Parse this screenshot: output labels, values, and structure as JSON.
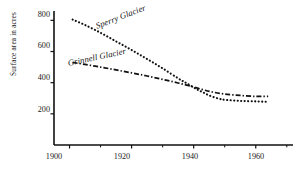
{
  "chart_data": {
    "type": "line",
    "title": "",
    "xlabel": "",
    "ylabel": "Surface area in acres",
    "xlim": [
      1895,
      1972
    ],
    "ylim": [
      0,
      860
    ],
    "grid": false,
    "legend_position": "inline-labels",
    "x_ticks": [
      1900,
      1920,
      1940,
      1960
    ],
    "x_tick_labels": [
      "1900",
      "1920",
      "1940",
      "1960"
    ],
    "x_minor_ticks": [
      1910,
      1930,
      1950,
      1970
    ],
    "y_ticks": [
      200,
      400,
      600,
      800
    ],
    "y_tick_labels": [
      "200",
      "400",
      "600",
      "800"
    ],
    "series": [
      {
        "name": "Sperry Glacier",
        "style": "dotted",
        "color": "#111111",
        "x": [
          1901,
          1905,
          1910,
          1915,
          1920,
          1925,
          1930,
          1935,
          1938,
          1941,
          1943,
          1945,
          1948,
          1950,
          1955,
          1960,
          1964
        ],
        "values": [
          805,
          770,
          720,
          665,
          610,
          552,
          492,
          428,
          393,
          358,
          338,
          318,
          298,
          290,
          283,
          280,
          277
        ]
      },
      {
        "name": "Grinnell Glacier",
        "style": "dash-dot",
        "color": "#111111",
        "x": [
          1901,
          1905,
          1910,
          1915,
          1920,
          1925,
          1930,
          1935,
          1940,
          1943,
          1946,
          1950,
          1955,
          1960,
          1964
        ],
        "values": [
          530,
          517,
          500,
          482,
          463,
          443,
          421,
          398,
          372,
          355,
          340,
          327,
          318,
          312,
          312
        ]
      }
    ],
    "annotations": [
      {
        "name": "sperry-series-label",
        "text": "Sperry Glacier"
      },
      {
        "name": "grinnell-series-label",
        "text": "Grinnell Glacier"
      }
    ]
  },
  "axes": {
    "y_title": "Surface area in acres"
  }
}
